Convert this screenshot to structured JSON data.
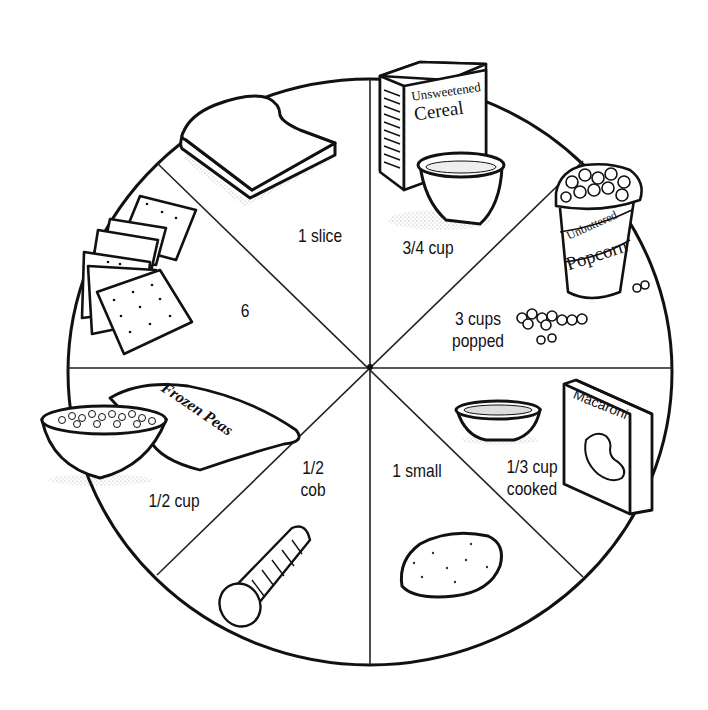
{
  "diagram": {
    "type": "pie-plate-illustration",
    "slice_count": 8,
    "stroke_color": "#111111",
    "background": "#ffffff",
    "slices": [
      {
        "food": "bread",
        "serving": "1 slice"
      },
      {
        "food": "unsweetened cereal",
        "serving": "3/4 cup",
        "package_text": [
          "Unsweetened",
          "Cereal"
        ]
      },
      {
        "food": "unbuttered popcorn",
        "serving_lines": [
          "3 cups",
          "popped"
        ],
        "package_text": [
          "Unbuttered",
          "Popcorn"
        ]
      },
      {
        "food": "macaroni",
        "serving_lines": [
          "1/3 cup",
          "cooked"
        ],
        "package_text": [
          "Macaroni"
        ]
      },
      {
        "food": "potato",
        "serving": "1 small"
      },
      {
        "food": "corn",
        "serving_lines": [
          "1/2",
          "cob"
        ]
      },
      {
        "food": "frozen peas",
        "serving": "1/2 cup",
        "package_text": [
          "Frozen Peas"
        ]
      },
      {
        "food": "crackers",
        "serving": "6"
      }
    ]
  }
}
